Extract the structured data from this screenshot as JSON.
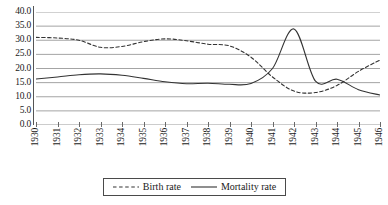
{
  "chart_data": {
    "type": "line",
    "title": "",
    "xlabel": "",
    "ylabel": "",
    "grid": true,
    "legend_position": "bottom-center",
    "xlim": [
      1930,
      1946
    ],
    "ylim": [
      0.0,
      40.0
    ],
    "ytick_step": 5.0,
    "categories": [
      "1930",
      "1931",
      "1932",
      "1933",
      "1934",
      "1935",
      "1936",
      "1937",
      "1938",
      "1939",
      "1940",
      "1941",
      "1942",
      "1943",
      "1944",
      "1945",
      "1946"
    ],
    "ytick_labels": [
      "40.0",
      "35.0",
      "30.0",
      "25.0",
      "20.0",
      "15.0",
      "10.0",
      "5.0",
      "0.0"
    ],
    "ytick_values": [
      40.0,
      35.0,
      30.0,
      25.0,
      20.0,
      15.0,
      10.0,
      5.0,
      0.0
    ],
    "series": [
      {
        "name": "Birth rate",
        "style": "dashed",
        "color": "#333333",
        "values": [
          31.0,
          30.8,
          30.0,
          27.5,
          27.8,
          29.5,
          30.5,
          29.8,
          28.6,
          28.0,
          24.0,
          17.0,
          12.0,
          11.5,
          14.0,
          19.0,
          23.0
        ]
      },
      {
        "name": "Mortality rate",
        "style": "solid",
        "color": "#333333",
        "values": [
          16.3,
          17.0,
          17.8,
          18.1,
          17.6,
          16.5,
          15.3,
          14.6,
          14.8,
          14.4,
          14.7,
          20.0,
          34.0,
          15.5,
          16.2,
          12.5,
          10.6
        ]
      }
    ]
  },
  "legend": {
    "items": [
      {
        "label": "Birth rate",
        "style": "dashed"
      },
      {
        "label": "Mortality rate",
        "style": "solid"
      }
    ]
  }
}
